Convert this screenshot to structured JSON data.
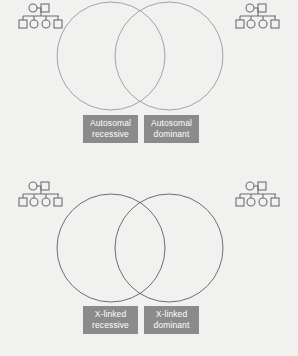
{
  "figure": {
    "background_color": "#f1f1f0",
    "circle_stroke_color_top": "#9a9a9e",
    "circle_stroke_color_bottom": "#5f5f63",
    "pedigree_stroke_color": "#6e6e72",
    "label_box_color": "#8b8b8b",
    "label_text_color": "#ffffff"
  },
  "diagrams": [
    {
      "id": "autosomal",
      "name": "autosomal-venn",
      "circles": [
        {
          "cx": 111,
          "cy": 56,
          "r": 54,
          "side": "left"
        },
        {
          "cx": 169,
          "cy": 56,
          "r": 54,
          "side": "right"
        }
      ],
      "labels": [
        {
          "line1": "Autosomal",
          "line2": "recessive",
          "side": "left"
        },
        {
          "line1": "Autosomal",
          "line2": "dominant",
          "side": "right"
        }
      ],
      "pedigrees": [
        {
          "position": "top-left"
        },
        {
          "position": "top-right"
        }
      ]
    },
    {
      "id": "xlinked",
      "name": "xlinked-venn",
      "circles": [
        {
          "cx": 111,
          "cy": 60,
          "r": 54,
          "side": "left"
        },
        {
          "cx": 169,
          "cy": 60,
          "r": 54,
          "side": "right"
        }
      ],
      "labels": [
        {
          "line1": "X-linked",
          "line2": "recessive",
          "side": "left"
        },
        {
          "line1": "X-linked",
          "line2": "dominant",
          "side": "right"
        }
      ],
      "pedigrees": [
        {
          "position": "bottom-left"
        },
        {
          "position": "bottom-right"
        }
      ]
    }
  ],
  "pedigree_symbol": {
    "description": "pedigree chart: circle and square parents joined by a horizontal line, with a descent line to a sibship line bearing four children: square, circle, circle, square",
    "parents": [
      "circle",
      "square"
    ],
    "children": [
      "square",
      "circle",
      "circle",
      "square"
    ]
  },
  "labels": {
    "autosomal_recessive": {
      "line1": "Autosomal",
      "line2": "recessive"
    },
    "autosomal_dominant": {
      "line1": "Autosomal",
      "line2": "dominant"
    },
    "xlinked_recessive": {
      "line1": "X-linked",
      "line2": "recessive"
    },
    "xlinked_dominant": {
      "line1": "X-linked",
      "line2": "dominant"
    }
  }
}
